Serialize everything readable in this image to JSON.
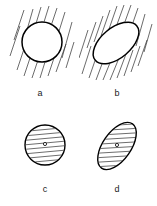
{
  "figure": {
    "background_color": "#ffffff",
    "line_color": "#000000",
    "hatch_color": "#3a3a3a",
    "width": 157,
    "height": 206,
    "panels": [
      {
        "id": "a",
        "label": "a",
        "label_x": 40,
        "label_y": 96,
        "shape": "circle",
        "fill": "unfilled",
        "hatch_location": "outside",
        "hatch_angle_deg": 72,
        "center_marker": false,
        "cx": 42,
        "cy": 42,
        "rx": 20,
        "ry": 20,
        "rotation_deg": 0,
        "hatch_count": 13,
        "hatch_field_width": 66,
        "hatch_field_height": 74
      },
      {
        "id": "b",
        "label": "b",
        "label_x": 117,
        "label_y": 96,
        "shape": "ellipse",
        "fill": "unfilled",
        "hatch_location": "outside",
        "hatch_angle_deg": 72,
        "center_marker": false,
        "cx": 116,
        "cy": 43,
        "rx": 27,
        "ry": 15,
        "rotation_deg": -40,
        "hatch_count": 15,
        "hatch_field_width": 74,
        "hatch_field_height": 78
      },
      {
        "id": "c",
        "label": "c",
        "label_x": 45,
        "label_y": 192,
        "shape": "circle",
        "fill": "hatched",
        "hatch_location": "inside",
        "hatch_angle_deg": 5,
        "center_marker": true,
        "cx": 45,
        "cy": 145,
        "rx": 20,
        "ry": 20,
        "rotation_deg": 0,
        "hatch_count": 9,
        "marker_r": 1.6
      },
      {
        "id": "d",
        "label": "d",
        "label_x": 117,
        "label_y": 192,
        "shape": "ellipse",
        "fill": "hatched",
        "hatch_location": "inside",
        "hatch_angle_deg": 3,
        "center_marker": true,
        "cx": 117,
        "cy": 146,
        "rx": 27,
        "ry": 14,
        "rotation_deg": -55,
        "hatch_count": 11,
        "marker_r": 1.6
      }
    ]
  }
}
